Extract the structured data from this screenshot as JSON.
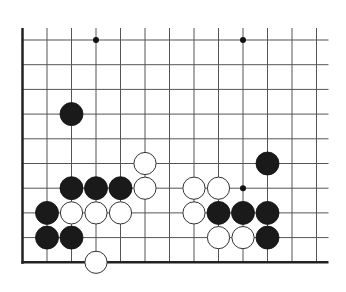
{
  "board": {
    "origin_x": 22.5,
    "origin_y": 40,
    "spacing_x": 24.5,
    "spacing_y": 24.7,
    "cols": 13,
    "rows": 10,
    "open_top": true,
    "open_right": true,
    "line_color": "#555555",
    "edge_color": "#222222",
    "background": "#ffffff"
  },
  "hoshi": [
    {
      "col": 3,
      "row": 0
    },
    {
      "col": 9,
      "row": 0
    },
    {
      "col": 9,
      "row": 6
    }
  ],
  "stones": [
    {
      "color": "black",
      "col": 2,
      "row": 3
    },
    {
      "color": "white",
      "col": 5,
      "row": 5
    },
    {
      "color": "black",
      "col": 2,
      "row": 6
    },
    {
      "color": "black",
      "col": 3,
      "row": 6
    },
    {
      "color": "black",
      "col": 4,
      "row": 6
    },
    {
      "color": "white",
      "col": 5,
      "row": 6
    },
    {
      "color": "black",
      "col": 1,
      "row": 7
    },
    {
      "color": "white",
      "col": 2,
      "row": 7
    },
    {
      "color": "white",
      "col": 3,
      "row": 7
    },
    {
      "color": "white",
      "col": 4,
      "row": 7
    },
    {
      "color": "black",
      "col": 1,
      "row": 8
    },
    {
      "color": "black",
      "col": 2,
      "row": 8
    },
    {
      "color": "white",
      "col": 3,
      "row": 9
    },
    {
      "color": "black",
      "col": 10,
      "row": 5
    },
    {
      "color": "white",
      "col": 7,
      "row": 6
    },
    {
      "color": "white",
      "col": 8,
      "row": 6
    },
    {
      "color": "white",
      "col": 7,
      "row": 7
    },
    {
      "color": "black",
      "col": 8,
      "row": 7
    },
    {
      "color": "black",
      "col": 9,
      "row": 7
    },
    {
      "color": "black",
      "col": 10,
      "row": 7
    },
    {
      "color": "white",
      "col": 8,
      "row": 8
    },
    {
      "color": "white",
      "col": 9,
      "row": 8
    },
    {
      "color": "black",
      "col": 10,
      "row": 8
    }
  ]
}
